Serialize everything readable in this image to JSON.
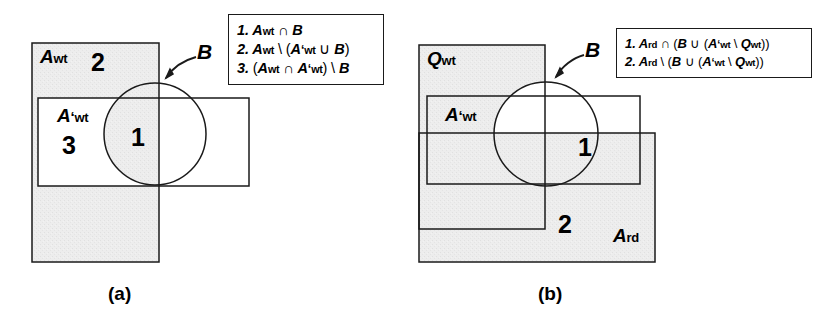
{
  "figure": {
    "caption_a": "(a)",
    "caption_b": "(b)",
    "circle_label": "B",
    "shade_color": "#ececec",
    "line_color": "#1a1a1a"
  },
  "panel_a": {
    "sets": {
      "a_wt_base": "A",
      "a_wt_sub": "wt",
      "a_prime_wt_base": "A",
      "a_prime_wt_prime": "‘",
      "a_prime_wt_sub": "wt",
      "circle": "B"
    },
    "regions": [
      {
        "id": "1",
        "label": "1"
      },
      {
        "id": "2",
        "label": "2"
      },
      {
        "id": "3",
        "label": "3"
      }
    ],
    "legend": [
      {
        "index": "1.",
        "parts": [
          {
            "t": "A",
            "k": "var"
          },
          {
            "t": "wt",
            "k": "sub"
          },
          {
            "t": " ∩ ",
            "k": "op"
          },
          {
            "t": "B",
            "k": "var"
          }
        ]
      },
      {
        "index": "2.",
        "parts": [
          {
            "t": "A",
            "k": "var"
          },
          {
            "t": "wt",
            "k": "sub"
          },
          {
            "t": " \\ (",
            "k": "op"
          },
          {
            "t": "A",
            "k": "var"
          },
          {
            "t": "‘",
            "k": "prime"
          },
          {
            "t": "wt",
            "k": "sub"
          },
          {
            "t": " ∪ ",
            "k": "op"
          },
          {
            "t": "B",
            "k": "var"
          },
          {
            "t": ")",
            "k": "op"
          }
        ]
      },
      {
        "index": "3.",
        "parts": [
          {
            "t": "(",
            "k": "op"
          },
          {
            "t": "A",
            "k": "var"
          },
          {
            "t": "wt",
            "k": "sub"
          },
          {
            "t": " ∩ ",
            "k": "op"
          },
          {
            "t": "A",
            "k": "var"
          },
          {
            "t": "‘",
            "k": "prime"
          },
          {
            "t": "wt",
            "k": "sub"
          },
          {
            "t": ") \\ ",
            "k": "op"
          },
          {
            "t": "B",
            "k": "var"
          }
        ]
      }
    ]
  },
  "panel_b": {
    "sets": {
      "q_wt_base": "Q",
      "q_wt_sub": "wt",
      "a_prime_wt_base": "A",
      "a_prime_wt_prime": "‘",
      "a_prime_wt_sub": "wt",
      "a_rd_base": "A",
      "a_rd_sub": "rd",
      "circle": "B"
    },
    "regions": [
      {
        "id": "1",
        "label": "1"
      },
      {
        "id": "2",
        "label": "2"
      }
    ],
    "legend": [
      {
        "index": "1.",
        "parts": [
          {
            "t": "A",
            "k": "var"
          },
          {
            "t": "rd",
            "k": "sub"
          },
          {
            "t": " ∩ (",
            "k": "op"
          },
          {
            "t": "B",
            "k": "var"
          },
          {
            "t": " ∪ (",
            "k": "op"
          },
          {
            "t": "A",
            "k": "var"
          },
          {
            "t": "‘",
            "k": "prime"
          },
          {
            "t": "wt",
            "k": "sub"
          },
          {
            "t": " \\ ",
            "k": "op"
          },
          {
            "t": "Q",
            "k": "var"
          },
          {
            "t": "wt",
            "k": "sub"
          },
          {
            "t": "))",
            "k": "op"
          }
        ]
      },
      {
        "index": "2.",
        "parts": [
          {
            "t": "A",
            "k": "var"
          },
          {
            "t": "rd",
            "k": "sub"
          },
          {
            "t": " \\ (",
            "k": "op"
          },
          {
            "t": "B",
            "k": "var"
          },
          {
            "t": " ∪ (",
            "k": "op"
          },
          {
            "t": "A",
            "k": "var"
          },
          {
            "t": "‘",
            "k": "prime"
          },
          {
            "t": "wt",
            "k": "sub"
          },
          {
            "t": " \\ ",
            "k": "op"
          },
          {
            "t": "Q",
            "k": "var"
          },
          {
            "t": "wt",
            "k": "sub"
          },
          {
            "t": "))",
            "k": "op"
          }
        ]
      }
    ]
  },
  "geometry": {
    "panel_a": {
      "a_wt_rect": {
        "x": 32,
        "y": 43,
        "w": 127,
        "h": 219
      },
      "a_prime_wt_rect": {
        "x": 38,
        "y": 98,
        "w": 211,
        "h": 88
      },
      "circle": {
        "cx": 155,
        "cy": 134,
        "r": 51
      }
    },
    "panel_b": {
      "q_wt_rect": {
        "x": 419,
        "y": 45,
        "w": 126,
        "h": 184
      },
      "a_prime_wt_rect": {
        "x": 427,
        "y": 96,
        "w": 213,
        "h": 88
      },
      "a_rd_rect": {
        "x": 419,
        "y": 133,
        "w": 236,
        "h": 129
      },
      "circle": {
        "cx": 546,
        "cy": 134,
        "r": 52
      }
    }
  }
}
